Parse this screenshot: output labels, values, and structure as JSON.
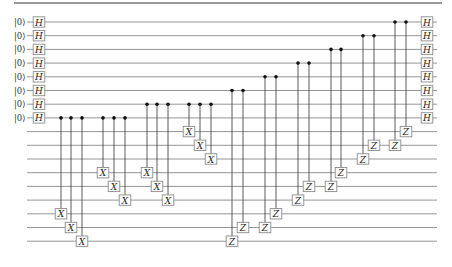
{
  "diagram": {
    "type": "quantum-circuit",
    "num_wires": 17,
    "num_data_qubits": 8,
    "initial_state_label": "|0⟩",
    "wire_y_start": 22,
    "wire_spacing": 13.7,
    "wire_x_start": 27,
    "wire_x_end": 437,
    "top_rule": {
      "x1": 14,
      "x2": 442,
      "y": 3
    },
    "initial_gates": {
      "label": "H",
      "x": 39,
      "wires": [
        0,
        1,
        2,
        3,
        4,
        5,
        6,
        7
      ]
    },
    "final_gates": {
      "label": "H",
      "x": 427,
      "wires": [
        0,
        1,
        2,
        3,
        4,
        5,
        6,
        7
      ]
    },
    "controlled_gates": [
      {
        "x": 61,
        "control": 7,
        "target": 14,
        "label": "X"
      },
      {
        "x": 71,
        "control": 7,
        "target": 15,
        "label": "X"
      },
      {
        "x": 82,
        "control": 7,
        "target": 16,
        "label": "X"
      },
      {
        "x": 103,
        "control": 7,
        "target": 11,
        "label": "X"
      },
      {
        "x": 114,
        "control": 7,
        "target": 12,
        "label": "X"
      },
      {
        "x": 125,
        "control": 7,
        "target": 13,
        "label": "X"
      },
      {
        "x": 147,
        "control": 6,
        "target": 11,
        "label": "X"
      },
      {
        "x": 157,
        "control": 6,
        "target": 12,
        "label": "X"
      },
      {
        "x": 168,
        "control": 6,
        "target": 13,
        "label": "X"
      },
      {
        "x": 189,
        "control": 6,
        "target": 8,
        "label": "X"
      },
      {
        "x": 200,
        "control": 6,
        "target": 9,
        "label": "X"
      },
      {
        "x": 211,
        "control": 6,
        "target": 10,
        "label": "X"
      },
      {
        "x": 232,
        "control": 5,
        "target": 16,
        "label": "Z"
      },
      {
        "x": 243,
        "control": 5,
        "target": 15,
        "label": "Z"
      },
      {
        "x": 265,
        "control": 4,
        "target": 15,
        "label": "Z"
      },
      {
        "x": 276,
        "control": 4,
        "target": 14,
        "label": "Z"
      },
      {
        "x": 298,
        "control": 3,
        "target": 13,
        "label": "Z"
      },
      {
        "x": 309,
        "control": 3,
        "target": 12,
        "label": "Z"
      },
      {
        "x": 331,
        "control": 2,
        "target": 12,
        "label": "Z"
      },
      {
        "x": 341,
        "control": 2,
        "target": 11,
        "label": "Z"
      },
      {
        "x": 363,
        "control": 1,
        "target": 10,
        "label": "Z"
      },
      {
        "x": 374,
        "control": 1,
        "target": 9,
        "label": "Z"
      },
      {
        "x": 395,
        "control": 0,
        "target": 9,
        "label": "Z"
      },
      {
        "x": 406,
        "control": 0,
        "target": 8,
        "label": "Z"
      }
    ]
  }
}
